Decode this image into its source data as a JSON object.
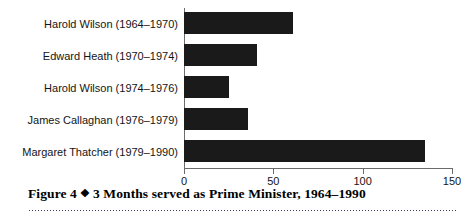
{
  "figure": {
    "caption_prefix": "Figure 4",
    "caption_separator": "❖",
    "caption_text": "3 Months served as Prime Minister, 1964–1990"
  },
  "chart_data": {
    "type": "bar",
    "orientation": "horizontal",
    "title": "",
    "subtitle": "",
    "xlabel": "",
    "ylabel": "",
    "xlim": [
      0,
      150
    ],
    "grid": false,
    "legend": false,
    "bar_color": "#1a1a1a",
    "axis_color": "#6b6b6b",
    "xticks": [
      0,
      50,
      100,
      150
    ],
    "xtick_labels": [
      "0",
      "50",
      "100",
      "150"
    ],
    "categories": [
      "Harold Wilson (1964–1970)",
      "Edward Heath (1970–1974)",
      "Harold Wilson (1974–1976)",
      "James Callaghan (1976–1979)",
      "Margaret Thatcher (1979–1990)"
    ],
    "values": [
      61,
      41,
      25,
      36,
      135
    ]
  }
}
